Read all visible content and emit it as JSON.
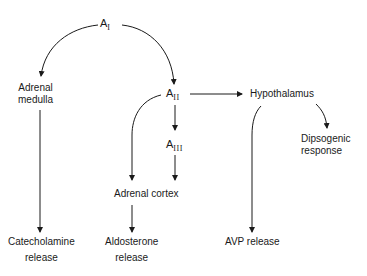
{
  "diagram": {
    "nodes": {
      "a1": {
        "base": "A",
        "sub": "I"
      },
      "a2": {
        "base": "A",
        "sub": "II"
      },
      "a3": {
        "base": "A",
        "sub": "III"
      },
      "adrenal_medulla": {
        "line1": "Adrenal",
        "line2": "medulla"
      },
      "hypothalamus": {
        "label": "Hypothalamus"
      },
      "dipsogenic": {
        "line1": "Dipsogenic",
        "line2": "response"
      },
      "adrenal_cortex": {
        "label": "Adrenal cortex"
      },
      "catecholamine": {
        "line1": "Catecholamine",
        "line2": "release"
      },
      "aldosterone": {
        "line1": "Aldosterone",
        "line2": "release"
      },
      "avp": {
        "label": "AVP release"
      }
    },
    "edges": [
      {
        "from": "A_I",
        "to": "Adrenal medulla"
      },
      {
        "from": "A_I",
        "to": "A_II"
      },
      {
        "from": "A_II",
        "to": "Hypothalamus"
      },
      {
        "from": "A_II",
        "to": "A_III"
      },
      {
        "from": "A_II",
        "to": "Adrenal cortex"
      },
      {
        "from": "A_III",
        "to": "Adrenal cortex"
      },
      {
        "from": "Adrenal medulla",
        "to": "Catecholamine release"
      },
      {
        "from": "Adrenal cortex",
        "to": "Aldosterone release"
      },
      {
        "from": "Hypothalamus",
        "to": "Dipsogenic response"
      },
      {
        "from": "Hypothalamus",
        "to": "AVP release"
      }
    ],
    "colors": {
      "line": "#1a1a1a",
      "background": "#ffffff"
    }
  }
}
